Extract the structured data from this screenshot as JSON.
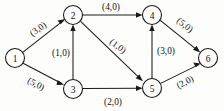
{
  "figure": {
    "type": "directed-network-flow-diagram",
    "background_color": "#fdfdfc",
    "ink_color": "#1a1a1a",
    "width": 224,
    "height": 111
  },
  "nodes": [
    {
      "id": "1",
      "label": "1",
      "cx": 15,
      "cy": 58,
      "r": 9.5
    },
    {
      "id": "2",
      "label": "2",
      "cx": 73,
      "cy": 15,
      "r": 9.5
    },
    {
      "id": "3",
      "label": "3",
      "cx": 73,
      "cy": 89,
      "r": 9.5
    },
    {
      "id": "4",
      "label": "4",
      "cx": 152,
      "cy": 15,
      "r": 9.5
    },
    {
      "id": "5",
      "label": "5",
      "cx": 152,
      "cy": 88,
      "r": 9.5
    },
    {
      "id": "6",
      "label": "6",
      "cx": 208,
      "cy": 58,
      "r": 9.5
    }
  ],
  "edges": [
    {
      "id": "e12",
      "from": "1",
      "to": "2",
      "label": "(3,0)",
      "capacity": 3,
      "flow": 0,
      "label_x": 38,
      "label_y": 29,
      "label_rotation": -36
    },
    {
      "id": "e13",
      "from": "1",
      "to": "3",
      "label": "(5,0)",
      "capacity": 5,
      "flow": 0,
      "label_x": 36,
      "label_y": 84,
      "label_rotation": 27
    },
    {
      "id": "e32",
      "from": "3",
      "to": "2",
      "label": "(1,0)",
      "capacity": 1,
      "flow": 0,
      "label_x": 61,
      "label_y": 53,
      "label_rotation": 0
    },
    {
      "id": "e24",
      "from": "2",
      "to": "4",
      "label": "(4,0)",
      "capacity": 4,
      "flow": 0,
      "label_x": 111,
      "label_y": 7,
      "label_rotation": 0
    },
    {
      "id": "e25",
      "from": "2",
      "to": "5",
      "label": "(1,0)",
      "capacity": 1,
      "flow": 0,
      "label_x": 118,
      "label_y": 46,
      "label_rotation": 37
    },
    {
      "id": "e35",
      "from": "3",
      "to": "5",
      "label": "(2,0)",
      "capacity": 2,
      "flow": 0,
      "label_x": 113,
      "label_y": 102,
      "label_rotation": 0
    },
    {
      "id": "e54",
      "from": "5",
      "to": "4",
      "label": "(3,0)",
      "capacity": 3,
      "flow": 0,
      "label_x": 166,
      "label_y": 51,
      "label_rotation": 0
    },
    {
      "id": "e46",
      "from": "4",
      "to": "6",
      "label": "(5,0)",
      "capacity": 5,
      "flow": 0,
      "label_x": 185,
      "label_y": 25,
      "label_rotation": 38
    },
    {
      "id": "e56",
      "from": "5",
      "to": "6",
      "label": "(2,0)",
      "capacity": 2,
      "flow": 0,
      "label_x": 185,
      "label_y": 82,
      "label_rotation": -28
    }
  ]
}
